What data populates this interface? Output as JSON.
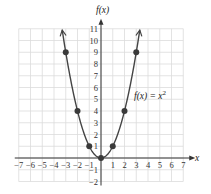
{
  "chart_data": {
    "type": "line",
    "title": "",
    "xlabel": "x",
    "ylabel": "f(x)",
    "xlim": [
      -7,
      7
    ],
    "ylim": [
      -2,
      11
    ],
    "grid": true,
    "x_ticks": [
      -7,
      -6,
      -5,
      -4,
      -3,
      -2,
      -1,
      1,
      2,
      3,
      4,
      5,
      6,
      7
    ],
    "y_ticks": [
      -2,
      -1,
      1,
      2,
      3,
      4,
      5,
      6,
      7,
      8,
      9,
      10,
      11
    ],
    "series": [
      {
        "name": "f(x) = x^2",
        "function": "x^2",
        "x_range": [
          -3.3,
          3.3
        ],
        "arrows_at_ends": true,
        "color": "#444444"
      }
    ],
    "points": [
      {
        "x": -3,
        "y": 9
      },
      {
        "x": -2,
        "y": 4
      },
      {
        "x": -1,
        "y": 1
      },
      {
        "x": 0,
        "y": 0
      },
      {
        "x": 1,
        "y": 1
      },
      {
        "x": 2,
        "y": 4
      },
      {
        "x": 3,
        "y": 9
      }
    ],
    "annotations": [
      {
        "text": "f(x) = x²",
        "x": 3.0,
        "y": 5.2
      }
    ]
  },
  "labels": {
    "x_axis": "x",
    "y_axis": "f(x)",
    "equation_prefix": "f(x) = x",
    "equation_exp": "2"
  }
}
